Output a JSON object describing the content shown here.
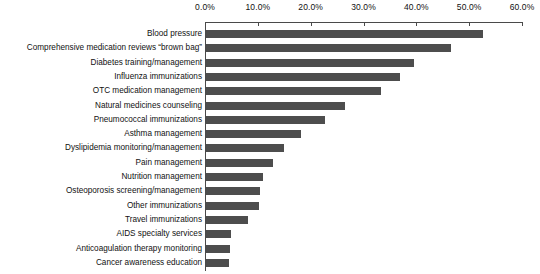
{
  "chart_data": {
    "type": "bar",
    "orientation": "horizontal",
    "title": "",
    "subtitle": "",
    "xlabel": "",
    "ylabel": "",
    "xlim": [
      0,
      60
    ],
    "xtick_labels": [
      "0.0%",
      "10.0%",
      "20.0%",
      "30.0%",
      "40.0%",
      "50.0%",
      "60.0%"
    ],
    "xtick_values": [
      0,
      10,
      20,
      30,
      40,
      50,
      60
    ],
    "grid": false,
    "legend": null,
    "bar_color": "#4d4d4d",
    "axis_color": "#4a4a4a",
    "categories": [
      "Blood pressure",
      "Comprehensive medication reviews “brown bag”",
      "Diabetes training/management",
      "Influenza immunizations",
      "OTC medication management",
      "Natural medicines counseling",
      "Pneumococcal immunizations",
      "Asthma management",
      "Dyslipidemia monitoring/management",
      "Pain management",
      "Nutrition management",
      "Osteoporosis screening/management",
      "Other immunizations",
      "Travel immunizations",
      "AIDS specialty services",
      "Anticoagulation therapy monitoring",
      "Cancer awareness education"
    ],
    "values": [
      52.5,
      46.4,
      39.4,
      36.7,
      33.1,
      26.3,
      22.5,
      18.0,
      14.7,
      12.7,
      10.8,
      10.3,
      10.1,
      8.0,
      4.7,
      4.6,
      4.4
    ]
  }
}
